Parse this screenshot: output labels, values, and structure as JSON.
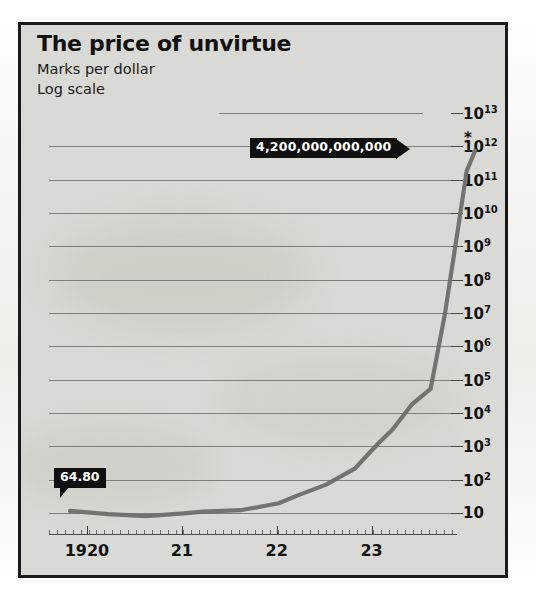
{
  "figure": {
    "title": "The price of unvirtue",
    "subtitle_1": "Marks per dollar",
    "subtitle_2": "Log scale",
    "footnote": "*November 15th, new currency issued",
    "frame_color": "#1a1a1a",
    "panel_color": "#d9d9d5",
    "series_color": "#6e6e6a",
    "callout_color": "#101010"
  },
  "annotations": {
    "peak_label": "4,200,000,000,000",
    "start_label": "64.80",
    "peak_marker": "*"
  },
  "axes": {
    "y_ticks": [
      {
        "label": "10",
        "exp": "13"
      },
      {
        "label": "10",
        "exp": "12"
      },
      {
        "label": "10",
        "exp": "11"
      },
      {
        "label": "10",
        "exp": "10"
      },
      {
        "label": "10",
        "exp": "9"
      },
      {
        "label": "10",
        "exp": "8"
      },
      {
        "label": "10",
        "exp": "7"
      },
      {
        "label": "10",
        "exp": "6"
      },
      {
        "label": "10",
        "exp": "5"
      },
      {
        "label": "10",
        "exp": "4"
      },
      {
        "label": "10",
        "exp": "3"
      },
      {
        "label": "10",
        "exp": "2"
      },
      {
        "label": "10",
        "exp": ""
      }
    ],
    "x_ticks": [
      "1920",
      "21",
      "22",
      "23"
    ]
  },
  "chart_data": {
    "type": "line",
    "title": "The price of unvirtue",
    "subtitle": "Marks per dollar",
    "xlabel": "",
    "ylabel": "Marks per dollar",
    "yscale": "log",
    "ylim": [
      10,
      10000000000000
    ],
    "ytick_values": [
      10,
      100,
      1000,
      10000,
      100000,
      1000000,
      10000000,
      100000000,
      1000000000,
      10000000000,
      100000000000,
      1000000000000,
      10000000000000
    ],
    "ytick_labels": [
      "10",
      "10²",
      "10³",
      "10⁴",
      "10⁵",
      "10⁶",
      "10⁷",
      "10⁸",
      "10⁹",
      "10¹⁰",
      "10¹¹",
      "10¹²",
      "10¹³"
    ],
    "xlim": [
      1919.6,
      1923.9
    ],
    "xtick_values": [
      1920,
      1921,
      1922,
      1923
    ],
    "xtick_labels": [
      "1920",
      "21",
      "22",
      "23"
    ],
    "grid": true,
    "legend": "none",
    "series": [
      {
        "name": "Marks per dollar",
        "x": [
          1919.6,
          1920.0,
          1920.4,
          1920.8,
          1921.0,
          1921.4,
          1921.8,
          1922.0,
          1922.3,
          1922.6,
          1922.85,
          1923.0,
          1923.2,
          1923.4,
          1923.55,
          1923.7,
          1923.78,
          1923.87
        ],
        "values": [
          64.8,
          52,
          45,
          55,
          62,
          68,
          110,
          190,
          400,
          1200,
          7000,
          18000,
          100000,
          300000,
          50000000,
          30000000000,
          1000000000000,
          4200000000000
        ]
      }
    ],
    "annotations": [
      {
        "text": "64.80",
        "x": 1919.6,
        "y": 64.8
      },
      {
        "text": "4,200,000,000,000",
        "x": 1923.87,
        "y": 4200000000000,
        "note": "*November 15th, new currency issued"
      }
    ]
  }
}
